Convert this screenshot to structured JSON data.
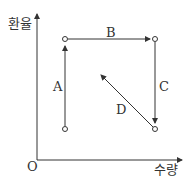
{
  "diagram": {
    "y_axis_label": "환율",
    "x_axis_label": "수량",
    "origin_label": "O",
    "arrows": [
      {
        "label": "A",
        "from": "bottom-left",
        "to": "top-left",
        "direction": "up"
      },
      {
        "label": "B",
        "from": "top-left",
        "to": "top-right",
        "direction": "right"
      },
      {
        "label": "C",
        "from": "top-right",
        "to": "bottom-right",
        "direction": "down"
      },
      {
        "label": "D",
        "from": "bottom-right",
        "to": "center",
        "direction": "up-left"
      }
    ],
    "points": [
      "top-left",
      "top-right",
      "bottom-left",
      "bottom-right"
    ],
    "line_color": "#333333"
  }
}
